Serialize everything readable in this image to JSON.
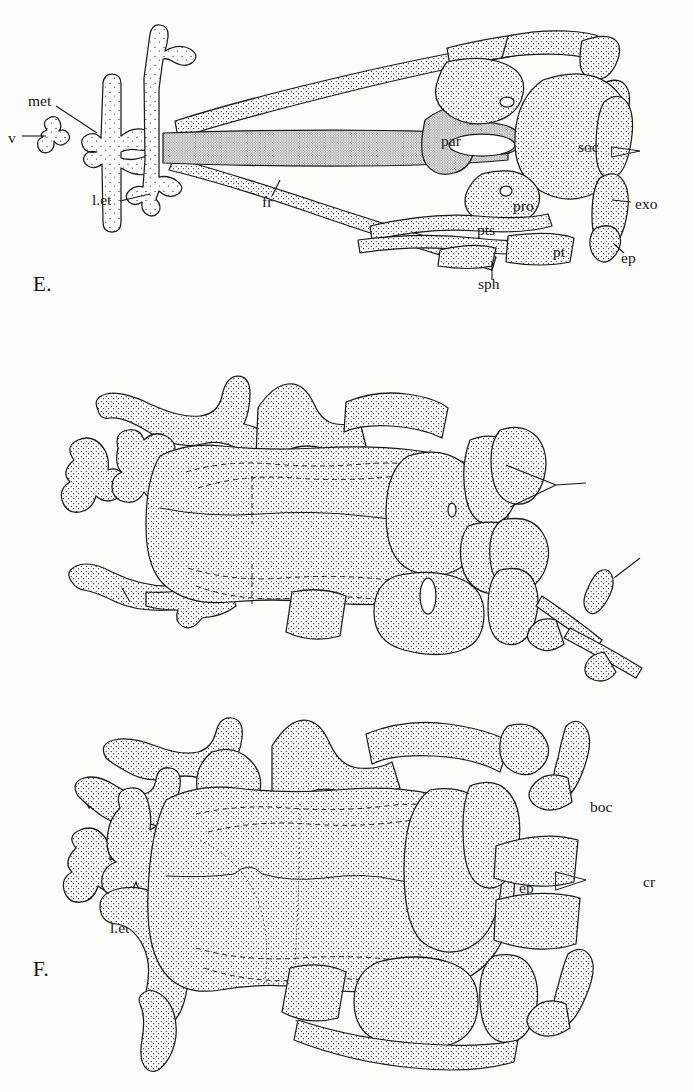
{
  "figure": {
    "background_color": "#fdfdfc",
    "ink_color": "#1b1b1b",
    "panel_count": 3
  },
  "panels": [
    {
      "id": "E",
      "letter": "E.",
      "labels": [
        {
          "key": "met",
          "text": "met",
          "x": 28,
          "y": 100,
          "leader": true
        },
        {
          "key": "v",
          "text": "v",
          "x": 8,
          "y": 139,
          "leader": true
        },
        {
          "key": "l.et",
          "text": "l.et",
          "x": 92,
          "y": 200,
          "leader": true
        },
        {
          "key": "fr",
          "text": "fr",
          "x": 262,
          "y": 202,
          "leader": true
        },
        {
          "key": "par",
          "text": "par",
          "x": 441,
          "y": 141,
          "leader": false
        },
        {
          "key": "soc",
          "text": "soc",
          "x": 578,
          "y": 147,
          "leader": false
        },
        {
          "key": "pro",
          "text": "pro",
          "x": 513,
          "y": 206,
          "leader": false
        },
        {
          "key": "pts",
          "text": "pts",
          "x": 477,
          "y": 230,
          "leader": false
        },
        {
          "key": "exo",
          "text": "exo",
          "x": 635,
          "y": 204,
          "leader": true
        },
        {
          "key": "pt",
          "text": "pt",
          "x": 553,
          "y": 252,
          "leader": false
        },
        {
          "key": "ep",
          "text": "ep",
          "x": 621,
          "y": 258,
          "leader": true
        },
        {
          "key": "sph",
          "text": "sph",
          "x": 478,
          "y": 284,
          "leader": true
        }
      ]
    },
    {
      "id": "F",
      "letter": "F.",
      "labels": [
        {
          "key": "v",
          "text": "v",
          "x": 85,
          "y": 484,
          "leader": false
        },
        {
          "key": "met",
          "text": "met",
          "x": 104,
          "y": 484,
          "leader": false
        },
        {
          "key": "l.et",
          "text": "l.et",
          "x": 110,
          "y": 608,
          "leader": true
        },
        {
          "key": "fr",
          "text": "fr",
          "x": 339,
          "y": 531,
          "leader": false
        },
        {
          "key": "soc",
          "text": "soc",
          "x": 455,
          "y": 487,
          "leader": false
        },
        {
          "key": "boc",
          "text": "boc",
          "x": 590,
          "y": 487,
          "leader": true
        },
        {
          "key": "exo",
          "text": "exo",
          "x": 537,
          "y": 534,
          "leader": false
        },
        {
          "key": "ep",
          "text": "ep",
          "x": 519,
          "y": 568,
          "leader": false
        },
        {
          "key": "cr",
          "text": "cr",
          "x": 643,
          "y": 562,
          "leader": true
        },
        {
          "key": "pt",
          "text": "pt",
          "x": 479,
          "y": 589,
          "leader": false
        },
        {
          "key": "sph",
          "text": "sph",
          "x": 361,
          "y": 609,
          "leader": false
        }
      ]
    },
    {
      "id": "G",
      "letter": "G.",
      "labels": [
        {
          "key": "l.et",
          "text": "l.et",
          "x": 160,
          "y": 746,
          "leader": false
        },
        {
          "key": "so",
          "text": "so",
          "x": 229,
          "y": 763,
          "leader": false
        },
        {
          "key": "n",
          "text": "n",
          "x": 169,
          "y": 789,
          "leader": false
        },
        {
          "key": "v",
          "text": "v",
          "x": 96,
          "y": 875,
          "leader": false
        },
        {
          "key": "met",
          "text": "met",
          "x": 129,
          "y": 874,
          "leader": false
        },
        {
          "key": "fr",
          "text": "fr",
          "x": 343,
          "y": 929,
          "leader": false
        },
        {
          "key": "soc",
          "text": "soc",
          "x": 461,
          "y": 876,
          "leader": false
        },
        {
          "key": "exo",
          "text": "exo",
          "x": 547,
          "y": 912,
          "leader": false
        },
        {
          "key": "ep",
          "text": "ep",
          "x": 516,
          "y": 990,
          "leader": false
        },
        {
          "key": "cr",
          "text": "cr",
          "x": 604,
          "y": 971,
          "leader": false
        },
        {
          "key": "pt",
          "text": "pt",
          "x": 448,
          "y": 995,
          "leader": false
        },
        {
          "key": "sph",
          "text": "sph",
          "x": 352,
          "y": 1014,
          "leader": false
        }
      ]
    }
  ],
  "abbreviations": {
    "met": "mesethmoid",
    "v": "vomer",
    "l.et": "lateral ethmoid",
    "fr": "frontal",
    "par": "parasphenoid",
    "soc": "supraoccipital",
    "pro": "prootic",
    "pts": "pterosphenoid",
    "exo": "exoccipital",
    "pt": "pterotic",
    "ep": "epiotic",
    "sph": "sphenotic",
    "boc": "basioccipital",
    "cr": "cranial rib",
    "so": "supraorbital",
    "n": "nasal"
  }
}
